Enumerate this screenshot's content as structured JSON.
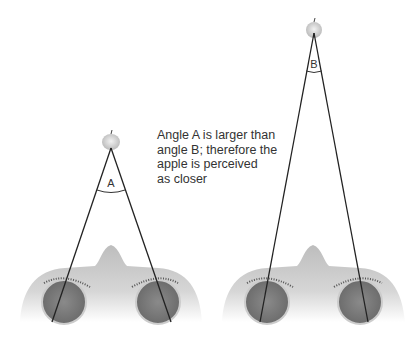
{
  "caption": {
    "lines": [
      "Angle A is larger than",
      "angle B; therefore the",
      "apple is perceived",
      "as closer"
    ]
  },
  "figures": [
    {
      "name": "near-apple",
      "angle_label": "A"
    },
    {
      "name": "far-apple",
      "angle_label": "B"
    }
  ],
  "colors": {
    "skin": "#b8b8b8",
    "eye": "#7a7a7a",
    "line": "#222222",
    "apple": "#d0d0d0"
  }
}
